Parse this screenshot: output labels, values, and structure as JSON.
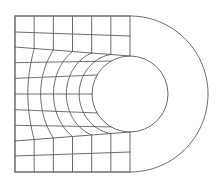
{
  "diagram": {
    "type": "finite-element-mesh",
    "canvas": {
      "width": 217,
      "height": 181,
      "background": "#ffffff"
    },
    "colors": {
      "mesh": "#5a5a5a",
      "outline": "#6a6a6a"
    },
    "rect": {
      "left": 15,
      "top": 16,
      "right": 130,
      "bottom": 172
    },
    "hole": {
      "cx": 130,
      "cy": 94,
      "r": 38
    },
    "outer_arc": {
      "cx": 130,
      "cy": 94,
      "r": 78
    },
    "mesh": {
      "columns": 6,
      "top_block": {
        "left_rows": [
          16,
          32,
          47
        ],
        "right_rows": [
          16,
          36,
          56
        ]
      },
      "middle_band_rows": 6,
      "bottom_block": {
        "left_rows": [
          141,
          156,
          172
        ],
        "right_rows": [
          132,
          152,
          172
        ]
      }
    }
  }
}
